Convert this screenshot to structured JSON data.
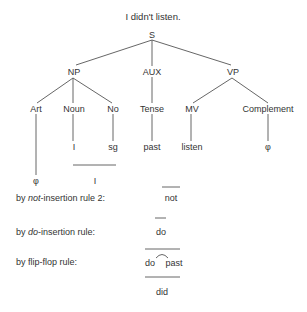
{
  "title": "I didn't listen.",
  "tree": {
    "root": "S",
    "level1": {
      "np": "NP",
      "aux": "AUX",
      "vp": "VP"
    },
    "level2": {
      "art": "Art",
      "noun": "Noun",
      "no": "No",
      "tense": "Tense",
      "mv": "MV",
      "complement": "Complement"
    },
    "level3": {
      "noun": "I",
      "no": "sg",
      "tense": "past",
      "mv": "listen",
      "complement": "φ"
    },
    "level4": {
      "art": "φ",
      "combined": "I"
    }
  },
  "derivation": [
    {
      "rule_prefix": "by ",
      "rule_italic": "not",
      "rule_suffix": "-insertion rule 2:",
      "result": "not"
    },
    {
      "rule_prefix": "by ",
      "rule_italic": "do",
      "rule_suffix": "-insertion rule:",
      "result": "do"
    },
    {
      "rule_prefix": "by flip-flop rule:",
      "rule_italic": "",
      "rule_suffix": "",
      "result_left": "do",
      "result_right": "past"
    }
  ],
  "final": "did",
  "colors": {
    "text": "#333333",
    "line": "#555555",
    "background": "#ffffff"
  }
}
